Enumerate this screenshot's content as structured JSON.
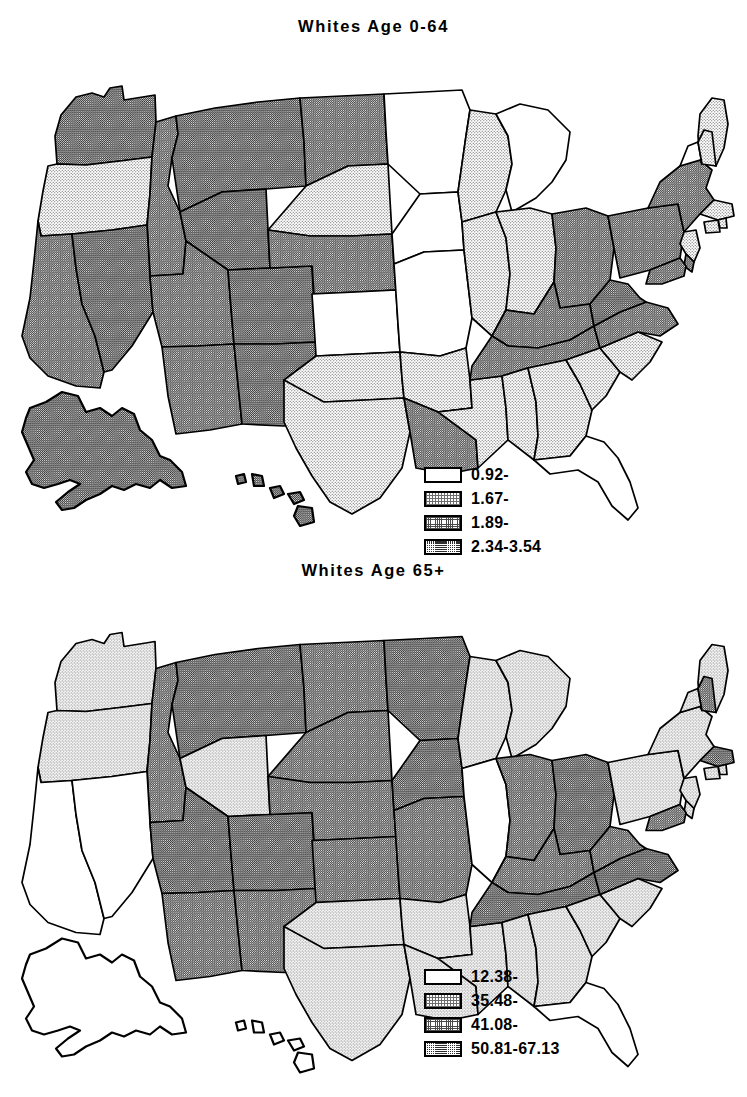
{
  "figure": {
    "type": "choropleth-map-pair",
    "background": "#ffffff",
    "line_color": "#000000"
  },
  "shading_levels": [
    {
      "id": "c0",
      "name": "lowest",
      "swatch": "white",
      "hex": "#ffffff"
    },
    {
      "id": "c1",
      "name": "low",
      "swatch": "light-stipple",
      "hex": "#dcdcdc"
    },
    {
      "id": "c2",
      "name": "high",
      "swatch": "medium-stipple",
      "hex": "#a8a8a8"
    },
    {
      "id": "c3",
      "name": "highest",
      "swatch": "dark-stipple",
      "hex": "#585858"
    }
  ],
  "maps": [
    {
      "title": "Whites Age 0-64",
      "legend": {
        "entries": [
          {
            "label": "0.92-",
            "level": "c0"
          },
          {
            "label": "1.67-",
            "level": "c1"
          },
          {
            "label": "1.89-",
            "level": "c2"
          },
          {
            "label": "2.34-3.54",
            "level": "c3"
          }
        ]
      },
      "states": {
        "WA": "c3",
        "OR": "c1",
        "CA": "c2",
        "NV": "c3",
        "ID": "c2",
        "MT": "c3",
        "WY": "c3",
        "UT": "c2",
        "AZ": "c2",
        "CO": "c3",
        "NM": "c3",
        "ND": "c2",
        "SD": "c1",
        "NE": "c2",
        "KS": "c0",
        "OK": "c1",
        "TX": "c1",
        "MN": "c0",
        "IA": "c0",
        "MO": "c0",
        "AR": "c1",
        "LA": "c2",
        "WI": "c1",
        "IL": "c1",
        "MS": "c1",
        "MI": "c0",
        "IN": "c1",
        "KY": "c2",
        "TN": "c2",
        "AL": "c1",
        "OH": "c2",
        "WV": "c3",
        "VA": "c2",
        "NC": "c1",
        "SC": "c1",
        "GA": "c1",
        "FL": "c0",
        "PA": "c2",
        "NY": "c2",
        "ME": "c1",
        "VT": "c0",
        "NH": "c1",
        "MA": "c1",
        "RI": "c1",
        "CT": "c1",
        "NJ": "c1",
        "DE": "c2",
        "MD": "c2",
        "AK": "c3",
        "HI": "c3"
      }
    },
    {
      "title": "Whites Age 65+",
      "legend": {
        "entries": [
          {
            "label": "12.38-",
            "level": "c0"
          },
          {
            "label": "35.48-",
            "level": "c1"
          },
          {
            "label": "41.08-",
            "level": "c2"
          },
          {
            "label": "50.81-67.13",
            "level": "c3"
          }
        ]
      },
      "states": {
        "WA": "c1",
        "OR": "c1",
        "CA": "c0",
        "NV": "c0",
        "ID": "c2",
        "MT": "c3",
        "WY": "c1",
        "UT": "c3",
        "AZ": "c2",
        "CO": "c3",
        "NM": "c2",
        "ND": "c2",
        "SD": "c2",
        "NE": "c2",
        "KS": "c2",
        "OK": "c1",
        "TX": "c1",
        "MN": "c3",
        "IA": "c3",
        "MO": "c2",
        "AR": "c1",
        "LA": "c1",
        "WI": "c1",
        "IL": "c0",
        "MS": "c1",
        "MI": "c1",
        "IN": "c2",
        "KY": "c2",
        "TN": "c3",
        "AL": "c1",
        "OH": "c3",
        "WV": "c2",
        "VA": "c3",
        "NC": "c1",
        "SC": "c1",
        "GA": "c1",
        "FL": "c0",
        "PA": "c1",
        "NY": "c1",
        "ME": "c1",
        "VT": "c1",
        "NH": "c2",
        "MA": "c3",
        "RI": "c1",
        "CT": "c1",
        "NJ": "c1",
        "DE": "c1",
        "MD": "c2",
        "AK": "c0",
        "HI": "c0"
      }
    }
  ]
}
